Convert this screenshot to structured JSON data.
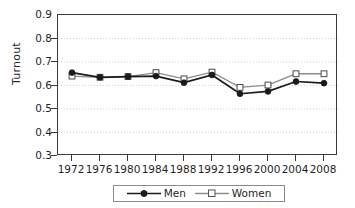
{
  "chart_data": {
    "type": "line",
    "title": "",
    "subtitle": "",
    "xlabel": "",
    "ylabel": "Turnout",
    "categories": [
      "1972",
      "1976",
      "1980",
      "1984",
      "1988",
      "1992",
      "1996",
      "2000",
      "2004",
      "2008"
    ],
    "x": [
      1972,
      1976,
      1980,
      1984,
      1988,
      1992,
      1996,
      2000,
      2004,
      2008
    ],
    "xlim": [
      1970,
      2010
    ],
    "ylim": [
      0.3,
      0.9
    ],
    "y_ticks": [
      0.3,
      0.4,
      0.5,
      0.6,
      0.7,
      0.8,
      0.9
    ],
    "y_tick_labels": [
      "0.3",
      "0.4",
      "0.5",
      "0.6",
      "0.7",
      "0.8",
      "0.9"
    ],
    "grid": true,
    "grid_style": "dotted-horizontal",
    "legend_position": "bottom-center",
    "series": [
      {
        "name": "Men",
        "marker": "filled-circle",
        "color": "#1a1a1a",
        "values": [
          0.655,
          0.635,
          0.638,
          0.64,
          0.612,
          0.645,
          0.565,
          0.575,
          0.617,
          0.61
        ]
      },
      {
        "name": "Women",
        "marker": "open-square",
        "color": "#8c8c8c",
        "values": [
          0.64,
          0.635,
          0.638,
          0.655,
          0.628,
          0.657,
          0.592,
          0.602,
          0.65,
          0.65
        ]
      }
    ]
  },
  "axes": {
    "y_title": "Turnout"
  },
  "legend": {
    "entries": [
      {
        "label": "Men"
      },
      {
        "label": "Women"
      }
    ]
  },
  "colors": {
    "men_line": "#1a1a1a",
    "women_line": "#8c8c8c",
    "frame": "#3a3a3a",
    "grid": "#c9c9c9",
    "text": "#1f1f1f",
    "background": "#ffffff"
  }
}
